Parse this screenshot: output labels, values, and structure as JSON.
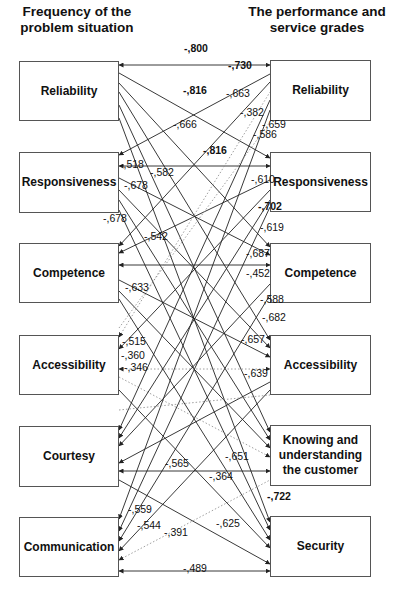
{
  "headings": {
    "left": "Frequency of the problem situation",
    "right": "The performance and service grades"
  },
  "left_boxes": [
    {
      "id": "L1",
      "label": "Reliability",
      "x": 19,
      "y": 61,
      "w": 100,
      "h": 60
    },
    {
      "id": "L2",
      "label": "Responsiveness",
      "x": 19,
      "y": 152,
      "w": 100,
      "h": 61
    },
    {
      "id": "L3",
      "label": "Competence",
      "x": 19,
      "y": 243,
      "w": 100,
      "h": 60
    },
    {
      "id": "L4",
      "label": "Accessibility",
      "x": 19,
      "y": 335,
      "w": 100,
      "h": 60
    },
    {
      "id": "L5",
      "label": "Courtesy",
      "x": 19,
      "y": 426,
      "w": 100,
      "h": 61
    },
    {
      "id": "L6",
      "label": "Communication",
      "x": 19,
      "y": 517,
      "w": 100,
      "h": 60
    }
  ],
  "right_boxes": [
    {
      "id": "R1",
      "label": "Reliability",
      "x": 270,
      "y": 60,
      "w": 101,
      "h": 61
    },
    {
      "id": "R2",
      "label": "Responsiveness",
      "x": 270,
      "y": 152,
      "w": 101,
      "h": 60
    },
    {
      "id": "R3",
      "label": "Competence",
      "x": 270,
      "y": 243,
      "w": 101,
      "h": 60
    },
    {
      "id": "R4",
      "label": "Accessibility",
      "x": 270,
      "y": 335,
      "w": 101,
      "h": 60
    },
    {
      "id": "R5",
      "label": "Knowing and understanding the customer",
      "x": 270,
      "y": 425,
      "w": 101,
      "h": 61
    },
    {
      "id": "R6",
      "label": "Security",
      "x": 270,
      "y": 516,
      "w": 101,
      "h": 61
    }
  ],
  "edges": [
    {
      "x1": 119,
      "y1": 65,
      "x2": 270,
      "y2": 65,
      "dashed": false,
      "arrow": "both"
    },
    {
      "x1": 119,
      "y1": 73,
      "x2": 270,
      "y2": 158,
      "dashed": false,
      "arrow": "end"
    },
    {
      "x1": 119,
      "y1": 83,
      "x2": 270,
      "y2": 247,
      "dashed": false,
      "arrow": "end"
    },
    {
      "x1": 119,
      "y1": 92,
      "x2": 270,
      "y2": 340,
      "dashed": false,
      "arrow": "end"
    },
    {
      "x1": 119,
      "y1": 105,
      "x2": 270,
      "y2": 432,
      "dashed": false,
      "arrow": "end"
    },
    {
      "x1": 119,
      "y1": 118,
      "x2": 270,
      "y2": 522,
      "dashed": false,
      "arrow": "end"
    },
    {
      "x1": 119,
      "y1": 155,
      "x2": 270,
      "y2": 74,
      "dashed": false,
      "arrow": "start"
    },
    {
      "x1": 119,
      "y1": 166,
      "x2": 270,
      "y2": 166,
      "dashed": false,
      "arrow": "both"
    },
    {
      "x1": 119,
      "y1": 178,
      "x2": 270,
      "y2": 255,
      "dashed": false,
      "arrow": "end"
    },
    {
      "x1": 119,
      "y1": 190,
      "x2": 270,
      "y2": 348,
      "dashed": false,
      "arrow": "end"
    },
    {
      "x1": 119,
      "y1": 200,
      "x2": 270,
      "y2": 440,
      "dashed": false,
      "arrow": "end"
    },
    {
      "x1": 119,
      "y1": 210,
      "x2": 270,
      "y2": 530,
      "dashed": false,
      "arrow": "end"
    },
    {
      "x1": 119,
      "y1": 246,
      "x2": 270,
      "y2": 82,
      "dashed": false,
      "arrow": "start"
    },
    {
      "x1": 119,
      "y1": 253,
      "x2": 270,
      "y2": 180,
      "dashed": false,
      "arrow": "start"
    },
    {
      "x1": 119,
      "y1": 265,
      "x2": 270,
      "y2": 265,
      "dashed": false,
      "arrow": "both"
    },
    {
      "x1": 119,
      "y1": 280,
      "x2": 270,
      "y2": 357,
      "dashed": false,
      "arrow": "end"
    },
    {
      "x1": 119,
      "y1": 291,
      "x2": 270,
      "y2": 448,
      "dashed": false,
      "arrow": "end"
    },
    {
      "x1": 119,
      "y1": 299,
      "x2": 270,
      "y2": 540,
      "dashed": false,
      "arrow": "end"
    },
    {
      "x1": 119,
      "y1": 337,
      "x2": 270,
      "y2": 92,
      "dashed": true,
      "arrow": "start"
    },
    {
      "x1": 119,
      "y1": 349,
      "x2": 270,
      "y2": 190,
      "dashed": false,
      "arrow": "start"
    },
    {
      "x1": 119,
      "y1": 369,
      "x2": 270,
      "y2": 369,
      "dashed": true,
      "arrow": "both"
    },
    {
      "x1": 119,
      "y1": 377,
      "x2": 270,
      "y2": 457,
      "dashed": true,
      "arrow": "end"
    },
    {
      "x1": 119,
      "y1": 390,
      "x2": 270,
      "y2": 548,
      "dashed": false,
      "arrow": "end"
    },
    {
      "x1": 119,
      "y1": 430,
      "x2": 270,
      "y2": 100,
      "dashed": false,
      "arrow": "start"
    },
    {
      "x1": 119,
      "y1": 438,
      "x2": 270,
      "y2": 200,
      "dashed": false,
      "arrow": "start"
    },
    {
      "x1": 119,
      "y1": 446,
      "x2": 270,
      "y2": 284,
      "dashed": false,
      "arrow": "start"
    },
    {
      "x1": 119,
      "y1": 463,
      "x2": 270,
      "y2": 382,
      "dashed": false,
      "arrow": "start"
    },
    {
      "x1": 119,
      "y1": 471,
      "x2": 270,
      "y2": 471,
      "dashed": false,
      "arrow": "both"
    },
    {
      "x1": 119,
      "y1": 480,
      "x2": 270,
      "y2": 564,
      "dashed": false,
      "arrow": "end"
    },
    {
      "x1": 119,
      "y1": 519,
      "x2": 270,
      "y2": 110,
      "dashed": false,
      "arrow": "start"
    },
    {
      "x1": 119,
      "y1": 531,
      "x2": 270,
      "y2": 207,
      "dashed": false,
      "arrow": "start"
    },
    {
      "x1": 119,
      "y1": 541,
      "x2": 270,
      "y2": 295,
      "dashed": false,
      "arrow": "start"
    },
    {
      "x1": 119,
      "y1": 551,
      "x2": 270,
      "y2": 390,
      "dashed": false,
      "arrow": "start"
    },
    {
      "x1": 119,
      "y1": 560,
      "x2": 270,
      "y2": 480,
      "dashed": true,
      "arrow": "start"
    },
    {
      "x1": 119,
      "y1": 571,
      "x2": 270,
      "y2": 571,
      "dashed": false,
      "arrow": "both"
    },
    {
      "x1": 119,
      "y1": 328,
      "x2": 270,
      "y2": 122,
      "dashed": true,
      "arrow": "none"
    },
    {
      "x1": 119,
      "y1": 410,
      "x2": 270,
      "y2": 395,
      "dashed": true,
      "arrow": "none"
    }
  ],
  "coefficients": [
    {
      "text": "-,800",
      "x": 184,
      "y": 52,
      "bold": true
    },
    {
      "text": "-,730",
      "x": 228,
      "y": 69,
      "bold": true
    },
    {
      "text": "-,816",
      "x": 183,
      "y": 94,
      "bold": true
    },
    {
      "text": "-,663",
      "x": 226,
      "y": 97,
      "bold": false
    },
    {
      "text": "-,382",
      "x": 240,
      "y": 116,
      "bold": false
    },
    {
      "text": "-,659",
      "x": 262,
      "y": 128,
      "bold": false
    },
    {
      "text": "-,586",
      "x": 253,
      "y": 138,
      "bold": false
    },
    {
      "text": "-,666",
      "x": 173,
      "y": 128,
      "bold": false
    },
    {
      "text": "-,816",
      "x": 203,
      "y": 154,
      "bold": true
    },
    {
      "text": "-,518",
      "x": 120,
      "y": 168,
      "bold": false
    },
    {
      "text": "-,582",
      "x": 150,
      "y": 176,
      "bold": false
    },
    {
      "text": "-,678",
      "x": 124,
      "y": 189,
      "bold": false
    },
    {
      "text": "-,610",
      "x": 251,
      "y": 183,
      "bold": false
    },
    {
      "text": "-,678",
      "x": 103,
      "y": 222,
      "bold": false
    },
    {
      "text": "-,702",
      "x": 258,
      "y": 210,
      "bold": true
    },
    {
      "text": "-,619",
      "x": 260,
      "y": 231,
      "bold": false
    },
    {
      "text": "-,542",
      "x": 144,
      "y": 240,
      "bold": false
    },
    {
      "text": "-,687",
      "x": 246,
      "y": 257,
      "bold": false
    },
    {
      "text": "-,452",
      "x": 246,
      "y": 277,
      "bold": false
    },
    {
      "text": "-,633",
      "x": 125,
      "y": 291,
      "bold": false
    },
    {
      "text": "-,588",
      "x": 260,
      "y": 303,
      "bold": false
    },
    {
      "text": "-,682",
      "x": 262,
      "y": 321,
      "bold": false
    },
    {
      "text": "-,515",
      "x": 122,
      "y": 345,
      "bold": false
    },
    {
      "text": "-,657",
      "x": 241,
      "y": 343,
      "bold": false
    },
    {
      "text": "-,360",
      "x": 121,
      "y": 359,
      "bold": false
    },
    {
      "text": "-,346",
      "x": 124,
      "y": 371,
      "bold": false
    },
    {
      "text": "-,639",
      "x": 244,
      "y": 377,
      "bold": false
    },
    {
      "text": "-,565",
      "x": 165,
      "y": 467,
      "bold": false
    },
    {
      "text": "-,651",
      "x": 225,
      "y": 460,
      "bold": false
    },
    {
      "text": "-,364",
      "x": 209,
      "y": 480,
      "bold": false
    },
    {
      "text": "-,722",
      "x": 267,
      "y": 500,
      "bold": true
    },
    {
      "text": "-,559",
      "x": 128,
      "y": 513,
      "bold": false
    },
    {
      "text": "-,544",
      "x": 137,
      "y": 529,
      "bold": false
    },
    {
      "text": "-,391",
      "x": 164,
      "y": 536,
      "bold": false
    },
    {
      "text": "-,625",
      "x": 216,
      "y": 527,
      "bold": false
    },
    {
      "text": "-,489",
      "x": 183,
      "y": 572,
      "bold": false
    }
  ],
  "colors": {
    "line": "#222222",
    "dashed": "#888888",
    "box_border": "#555555"
  }
}
